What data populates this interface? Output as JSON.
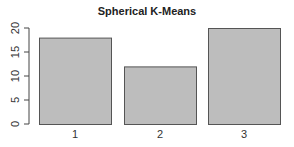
{
  "chart_data": {
    "type": "bar",
    "title": "Spherical K-Means",
    "categories": [
      "1",
      "2",
      "3"
    ],
    "values": [
      18,
      12,
      20
    ],
    "xlabel": "",
    "ylabel": "",
    "ylim": [
      0,
      20
    ],
    "yticks": [
      0,
      5,
      10,
      15,
      20
    ],
    "grid": false,
    "legend": null,
    "bar_color": "#bdbdbd",
    "bar_edge_color": "#555555"
  }
}
